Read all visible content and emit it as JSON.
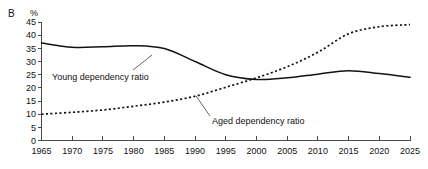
{
  "panel": {
    "letter": "B",
    "unit": "%"
  },
  "chart_data": {
    "type": "line",
    "title": "",
    "subtitle": "",
    "xlabel": "",
    "ylabel": "%",
    "xlim": [
      1965,
      2025
    ],
    "ylim": [
      0,
      45
    ],
    "grid": false,
    "legend_position": "inline-annotation",
    "x_ticks": [
      1965,
      1970,
      1975,
      1980,
      1985,
      1990,
      1995,
      2000,
      2005,
      2010,
      2015,
      2020,
      2025
    ],
    "y_ticks": [
      0,
      5,
      10,
      15,
      20,
      25,
      30,
      35,
      40,
      45
    ],
    "x": [
      1965,
      1970,
      1975,
      1980,
      1985,
      1990,
      1995,
      2000,
      2005,
      2010,
      2015,
      2020,
      2025
    ],
    "series": [
      {
        "name": "Young dependency ratio",
        "style": "solid",
        "color": "#121212",
        "values": [
          37.0,
          35.4,
          35.6,
          36.0,
          34.9,
          30.0,
          25.0,
          23.2,
          23.8,
          25.2,
          26.5,
          25.4,
          24.0
        ]
      },
      {
        "name": "Aged dependency ratio",
        "style": "dotted",
        "color": "#121212",
        "values": [
          10.0,
          10.7,
          11.6,
          13.0,
          14.6,
          16.8,
          20.2,
          23.8,
          28.0,
          33.5,
          40.5,
          43.2,
          44.0
        ]
      }
    ],
    "annotations": [
      {
        "text": "Young dependency ratio",
        "series": "Young dependency ratio",
        "label_x": 52,
        "label_y": 80,
        "leader_from_x": 133,
        "leader_from_y": 70,
        "leader_to_x": 152,
        "leader_to_y": 55
      },
      {
        "text": "Aged dependency ratio",
        "series": "Aged dependency ratio",
        "label_x": 212,
        "label_y": 124,
        "leader_from_x": 210,
        "leader_from_y": 116,
        "leader_to_x": 196,
        "leader_to_y": 96
      }
    ]
  }
}
